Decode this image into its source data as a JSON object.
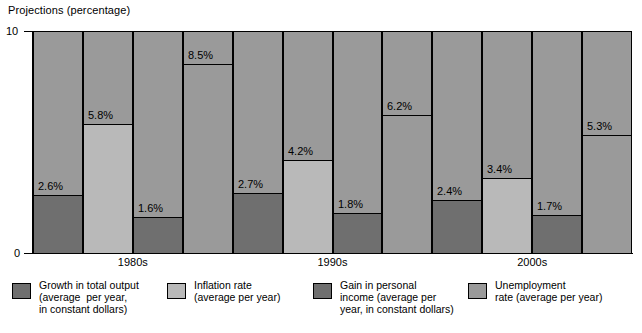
{
  "chart_data": {
    "type": "bar",
    "title": "Projections (percentage)",
    "xlabel": "",
    "ylabel": "Projections (percentage)",
    "ylim": [
      0,
      10
    ],
    "ytick_labels": [
      "0",
      "10"
    ],
    "grid": false,
    "legend_position": "bottom",
    "categories": [
      "1980s",
      "1990s",
      "2000s"
    ],
    "series": [
      {
        "name": "Growth in total output (average per year, in constant dollars)",
        "color": "#6f6f6f",
        "values": [
          2.6,
          2.7,
          2.4
        ],
        "labels": [
          "2.6%",
          "2.7%",
          "2.4%"
        ]
      },
      {
        "name": "Inflation rate (average per year)",
        "color": "#b9b9b9",
        "values": [
          5.8,
          4.2,
          3.4
        ],
        "labels": [
          "5.8%",
          "4.2%",
          "3.4%"
        ]
      },
      {
        "name": "Gain in personal income (average per year, in constant dollars)",
        "color": "#6f6f6f",
        "values": [
          1.6,
          1.8,
          1.7
        ],
        "labels": [
          "1.6%",
          "1.8%",
          "1.7%"
        ]
      },
      {
        "name": "Unemployment rate (average per year)",
        "color": "#9a9a9a",
        "values": [
          8.5,
          6.2,
          5.3
        ],
        "labels": [
          "8.5%",
          "6.2%",
          "5.3%"
        ]
      }
    ],
    "column_background_color": "#9a9a9a",
    "bars": [
      {
        "group": "1980s",
        "series": "Growth in total output (average per year, in constant dollars)",
        "label": "2.6%",
        "value": 2.6,
        "fill": "#6f6f6f"
      },
      {
        "group": "1980s",
        "series": "Inflation rate (average per year)",
        "label": "5.8%",
        "value": 5.8,
        "fill": "#b9b9b9"
      },
      {
        "group": "1980s",
        "series": "Gain in personal income (average per year, in constant dollars)",
        "label": "1.6%",
        "value": 1.6,
        "fill": "#6f6f6f"
      },
      {
        "group": "1980s",
        "series": "Unemployment rate (average per year)",
        "label": "8.5%",
        "value": 8.5,
        "fill": "#9a9a9a"
      },
      {
        "group": "1990s",
        "series": "Growth in total output (average per year, in constant dollars)",
        "label": "2.7%",
        "value": 2.7,
        "fill": "#6f6f6f"
      },
      {
        "group": "1990s",
        "series": "Inflation rate (average per year)",
        "label": "4.2%",
        "value": 4.2,
        "fill": "#b9b9b9"
      },
      {
        "group": "1990s",
        "series": "Gain in personal income (average per year, in constant dollars)",
        "label": "1.8%",
        "value": 1.8,
        "fill": "#6f6f6f"
      },
      {
        "group": "1990s",
        "series": "Unemployment rate (average per year)",
        "label": "6.2%",
        "value": 6.2,
        "fill": "#9a9a9a"
      },
      {
        "group": "2000s",
        "series": "Growth in total output (average per year, in constant dollars)",
        "label": "2.4%",
        "value": 2.4,
        "fill": "#6f6f6f"
      },
      {
        "group": "2000s",
        "series": "Inflation rate (average per year)",
        "label": "3.4%",
        "value": 3.4,
        "fill": "#b9b9b9"
      },
      {
        "group": "2000s",
        "series": "Gain in personal income (average per year, in constant dollars)",
        "label": "1.7%",
        "value": 1.7,
        "fill": "#6f6f6f"
      },
      {
        "group": "2000s",
        "series": "Unemployment rate (average per year)",
        "label": "5.3%",
        "value": 5.3,
        "fill": "#9a9a9a"
      }
    ]
  },
  "axis": {
    "title": "Projections (percentage)",
    "y_top_label": "10",
    "y_bottom_label": "0"
  },
  "x_labels": [
    "1980s",
    "1990s",
    "2000s"
  ],
  "legend": {
    "items": [
      {
        "swatch_color": "#6f6f6f",
        "lines": [
          "Growth in total output",
          "(average  per year,",
          "in constant dollars)"
        ]
      },
      {
        "swatch_color": "#b9b9b9",
        "lines": [
          "Inflation rate",
          "(average per year)"
        ]
      },
      {
        "swatch_color": "#6f6f6f",
        "lines": [
          "Gain in personal",
          "income (average per",
          "year, in constant dollars)"
        ]
      },
      {
        "swatch_color": "#9a9a9a",
        "lines": [
          "Unemployment",
          "rate (average per year)"
        ]
      }
    ]
  }
}
